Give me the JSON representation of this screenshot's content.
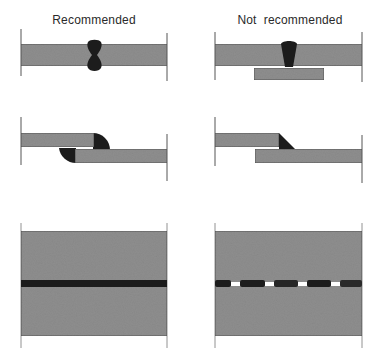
{
  "columns": [
    {
      "heading": "Recommended"
    },
    {
      "heading": "Not  recommended"
    }
  ],
  "rows": [
    {
      "name": "butt-weld",
      "recommended": "double-sided full penetration butt weld",
      "not_recommended": "single-sided butt weld with backing strip"
    },
    {
      "name": "lap-weld",
      "recommended": "lap joint welded on both sides",
      "not_recommended": "lap joint welded on one side only"
    },
    {
      "name": "plan-view-weld",
      "recommended": "continuous weld",
      "not_recommended": "intermittent weld"
    }
  ],
  "colors": {
    "plate": "#8e8e8e",
    "plate_edge": "#4a4a4a",
    "weld": "#1c1c1c",
    "line": "#555555",
    "background": "#ffffff"
  }
}
